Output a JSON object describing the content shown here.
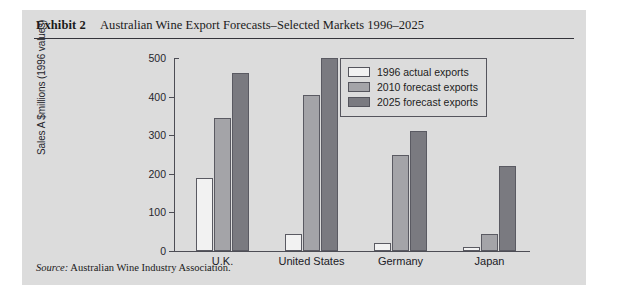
{
  "exhibit": {
    "label": "Exhibit 2",
    "title": "Australian Wine Export Forecasts–Selected Markets 1996–2025",
    "source_label": "Source:",
    "source_text": "Australian Wine Industry Association."
  },
  "chart_data": {
    "type": "bar",
    "title": "Australian Wine Export Forecasts–Selected Markets 1996–2025",
    "categories": [
      "U.K.",
      "United States",
      "Germany",
      "Japan"
    ],
    "series": [
      {
        "name": "1996 actual exports",
        "values": [
          190,
          45,
          20,
          10
        ],
        "color": "#f2f2f2"
      },
      {
        "name": "2010 forecast exports",
        "values": [
          345,
          405,
          250,
          45
        ],
        "color": "#a4a4a8"
      },
      {
        "name": "2025 forecast exports",
        "values": [
          460,
          500,
          312,
          220
        ],
        "color": "#7a7a80"
      }
    ],
    "xlabel": "",
    "ylabel": "Sales A $millions (1996 values)",
    "ylim": [
      0,
      500
    ],
    "yticks": [
      0,
      100,
      200,
      300,
      400,
      500
    ],
    "ytick_labels": [
      "0",
      "100",
      "200",
      "300",
      "400",
      "500"
    ],
    "grid": false,
    "legend_position": "top-right"
  }
}
